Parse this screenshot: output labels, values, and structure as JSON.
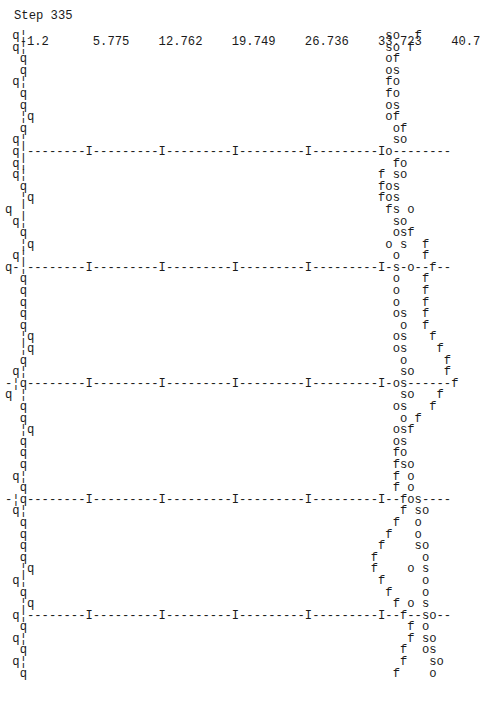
{
  "chart_data": {
    "type": "scatter",
    "title": "Step 335",
    "render_style": "ascii-text-plot",
    "x_ticks": [
      "-1.2",
      "5.775",
      "12.762",
      "19.749",
      "26.736",
      "33.723",
      "40.7"
    ],
    "xlim": [
      -1.2,
      40.7
    ],
    "series_symbols": [
      "q",
      "s",
      "o",
      "f"
    ],
    "rows": [
      " q¦                                                 so  f",
      " q¦                                                 so f",
      "  q                                                 of",
      "  q                                                 os",
      " q¦                                                 fo",
      "  q                                                 fo",
      "  q                                                 os",
      "  ¦q                                                of",
      "  q                                                  of",
      " q¦                                                  so",
      " q¦--------I---------I---------I---------I---------Io--------",
      " q¦                                                  fo",
      " q¦                                                f so",
      "  q                                                fos",
      "  ¦q                                               fos",
      "q ¦                                                 fs o",
      " q¦                                                  so",
      "  q                                                  osf",
      "  ¦q                                                o s  f",
      " q¦                                                  o   f",
      "q-¦--------I---------I---------I---------I---------I-s-o--f--",
      "  q                                                  o   f",
      "  q                                                  o   f",
      "  q                                                  o   f",
      "  q                                                  os  f",
      "  q                                                   o  f",
      "  ¦q                                                 os   f",
      "  ¦q                                                 os    f",
      "  q                                                   o     f",
      " q¦                                                   so    f",
      "-¦q--------I---------I---------I---------I---------I-os------f",
      "q ¦                                                   so   f",
      "  q                                                  os   f",
      "  q                                                   o f",
      "  ¦q                                                 osf",
      "  q                                                  os",
      "  q                                                  fo",
      "  q                                                  fso",
      " q¦                                                  f o",
      "  q                                                  f o",
      "-¦q--------I---------I---------I---------I---------I--fos----",
      " q¦                                                   f so",
      "  q                                                  f  o",
      "  q                                                 f   o",
      "  q                                                f    so",
      "  q                                               f      o",
      "  ¦q                                              f    o s",
      " q¦                                                f     o",
      "  q                                                 f    o",
      "  ¦q                                                 f o s",
      " q¦--------I---------I---------I---------I---------I--f--so--",
      "  q                                                    f o",
      " q¦                                                    f so",
      "  q                                                   f  os",
      " q¦                                                   f   so",
      "  q                                                  f    o"
    ]
  }
}
